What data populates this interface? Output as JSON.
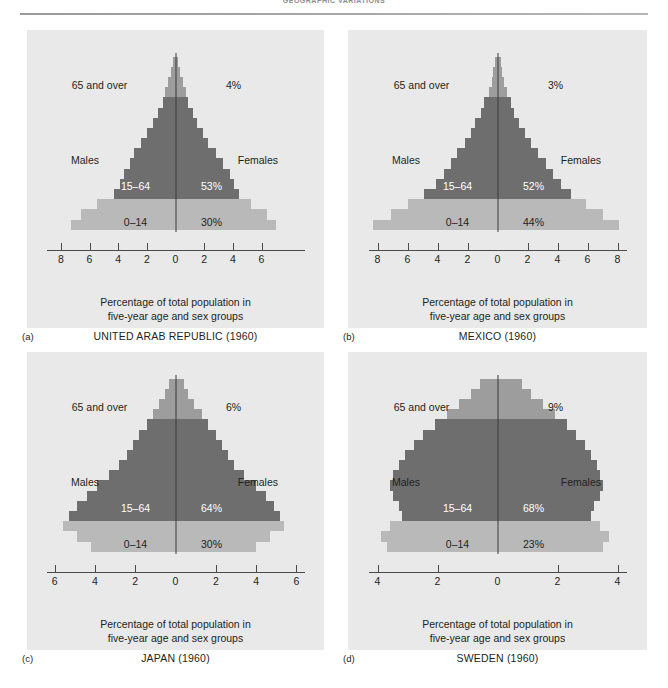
{
  "page": {
    "running_head": "GEOGRAPHIC VARIATIONS",
    "figure_labels": [
      "(a)",
      "(b)",
      "(c)",
      "(d)"
    ]
  },
  "common": {
    "caption_line1": "Percentage of total population in",
    "caption_line2": "five-year age and sex groups",
    "label_old": "65 and over",
    "label_work": "15–64",
    "label_young": "0–14",
    "label_males": "Males",
    "label_females": "Females"
  },
  "colors": {
    "young": "#b9b9b9",
    "working": "#6e6e6e",
    "old": "#9d9d9d",
    "panel_bg": "#e9e9e9",
    "axis": "#4a4a4a",
    "text": "#231f20"
  },
  "chart_data": [
    {
      "id": "a",
      "type": "bar",
      "title": "UNITED ARAB REPUBLIC (1960)",
      "country": "UNITED ARAB REPUBLIC (1960)",
      "year": 1960,
      "orientation": "population-pyramid",
      "xlabel": "Percentage of total population in five-year age and sex groups",
      "ylabel": "",
      "xlim": [
        -9,
        7.5
      ],
      "ticks": [
        8,
        6,
        4,
        2,
        0,
        2,
        4,
        6
      ],
      "tick_positions": [
        -8,
        -6,
        -4,
        -2,
        0,
        2,
        4,
        6
      ],
      "axis_left_cap": true,
      "axis_right_cap": false,
      "grid": false,
      "pct_old": "4%",
      "pct_working": "53%",
      "pct_young": "30%",
      "age_groups": [
        "0–4",
        "5–9",
        "10–14",
        "15–19",
        "20–24",
        "25–29",
        "30–34",
        "35–39",
        "40–44",
        "45–49",
        "50–54",
        "55–59",
        "60–64",
        "65–69",
        "70–74",
        "75–79",
        "80+"
      ],
      "series": [
        {
          "name": "Males",
          "values": [
            7.3,
            6.6,
            5.5,
            4.3,
            3.9,
            3.6,
            3.2,
            2.9,
            2.4,
            2.0,
            1.6,
            1.2,
            0.9,
            0.7,
            0.5,
            0.3,
            0.2
          ]
        },
        {
          "name": "Females",
          "values": [
            7.0,
            6.4,
            5.3,
            4.4,
            4.1,
            3.8,
            3.3,
            2.8,
            2.3,
            1.9,
            1.5,
            1.2,
            0.9,
            0.7,
            0.5,
            0.3,
            0.2
          ]
        }
      ],
      "bands": [
        "young",
        "young",
        "young",
        "work",
        "work",
        "work",
        "work",
        "work",
        "work",
        "work",
        "work",
        "work",
        "work",
        "old",
        "old",
        "old",
        "old"
      ]
    },
    {
      "id": "b",
      "type": "bar",
      "title": "MEXICO (1960)",
      "country": "MEXICO (1960)",
      "year": 1960,
      "orientation": "population-pyramid",
      "xlabel": "Percentage of total population in five-year age and sex groups",
      "ylabel": "",
      "xlim": [
        -8.6,
        8.6
      ],
      "ticks": [
        8,
        6,
        4,
        2,
        0,
        2,
        4,
        6,
        8
      ],
      "tick_positions": [
        -8,
        -6,
        -4,
        -2,
        0,
        2,
        4,
        6,
        8
      ],
      "axis_left_cap": true,
      "axis_right_cap": true,
      "grid": false,
      "pct_old": "3%",
      "pct_working": "52%",
      "pct_young": "44%",
      "age_groups": [
        "0–4",
        "5–9",
        "10–14",
        "15–19",
        "20–24",
        "25–29",
        "30–34",
        "35–39",
        "40–44",
        "45–49",
        "50–54",
        "55–59",
        "60–64",
        "65–69",
        "70–74",
        "75–79",
        "80+"
      ],
      "series": [
        {
          "name": "Males",
          "values": [
            8.3,
            7.1,
            6.0,
            4.9,
            4.1,
            3.6,
            3.1,
            2.7,
            2.2,
            1.8,
            1.5,
            1.1,
            0.9,
            0.6,
            0.4,
            0.3,
            0.2
          ]
        },
        {
          "name": "Females",
          "values": [
            8.1,
            7.0,
            5.9,
            4.9,
            4.2,
            3.7,
            3.2,
            2.7,
            2.2,
            1.8,
            1.4,
            1.1,
            0.9,
            0.6,
            0.4,
            0.3,
            0.2
          ]
        }
      ],
      "bands": [
        "young",
        "young",
        "young",
        "work",
        "work",
        "work",
        "work",
        "work",
        "work",
        "work",
        "work",
        "work",
        "work",
        "old",
        "old",
        "old",
        "old"
      ]
    },
    {
      "id": "c",
      "type": "bar",
      "title": "JAPAN (1960)",
      "country": "JAPAN (1960)",
      "year": 1960,
      "orientation": "population-pyramid",
      "xlabel": "Percentage of total population in five-year age and sex groups",
      "ylabel": "",
      "xlim": [
        -6.4,
        6.4
      ],
      "ticks": [
        6,
        4,
        2,
        0,
        2,
        4,
        6
      ],
      "tick_positions": [
        -6,
        -4,
        -2,
        0,
        2,
        4,
        6
      ],
      "axis_left_cap": true,
      "axis_right_cap": true,
      "grid": false,
      "pct_old": "6%",
      "pct_working": "64%",
      "pct_young": "30%",
      "age_groups": [
        "0–4",
        "5–9",
        "10–14",
        "15–19",
        "20–24",
        "25–29",
        "30–34",
        "35–39",
        "40–44",
        "45–49",
        "50–54",
        "55–59",
        "60–64",
        "65–69",
        "70–74",
        "75–79",
        "80+"
      ],
      "series": [
        {
          "name": "Males",
          "values": [
            4.2,
            4.9,
            5.6,
            5.3,
            4.9,
            4.4,
            3.9,
            3.3,
            2.8,
            2.4,
            2.1,
            1.8,
            1.4,
            1.1,
            0.8,
            0.5,
            0.3
          ]
        },
        {
          "name": "Females",
          "values": [
            4.0,
            4.7,
            5.4,
            5.2,
            4.9,
            4.5,
            4.0,
            3.4,
            2.9,
            2.6,
            2.3,
            2.0,
            1.6,
            1.3,
            0.9,
            0.6,
            0.4
          ]
        }
      ],
      "bands": [
        "young",
        "young",
        "young",
        "work",
        "work",
        "work",
        "work",
        "work",
        "work",
        "work",
        "work",
        "work",
        "work",
        "old",
        "old",
        "old",
        "old"
      ]
    },
    {
      "id": "d",
      "type": "bar",
      "title": "SWEDEN (1960)",
      "country": "SWEDEN (1960)",
      "year": 1960,
      "orientation": "population-pyramid",
      "xlabel": "Percentage of total population in five-year age and sex groups",
      "ylabel": "",
      "xlim": [
        -4.3,
        4.3
      ],
      "ticks": [
        4,
        2,
        0,
        2,
        4
      ],
      "tick_positions": [
        -4,
        -2,
        0,
        2,
        4
      ],
      "axis_left_cap": true,
      "axis_right_cap": true,
      "grid": false,
      "pct_old": "9%",
      "pct_working": "68%",
      "pct_young": "23%",
      "age_groups": [
        "0–4",
        "5–9",
        "10–14",
        "15–19",
        "20–24",
        "25–29",
        "30–34",
        "35–39",
        "40–44",
        "45–49",
        "50–54",
        "55–59",
        "60–64",
        "65–69",
        "70–74",
        "75–79",
        "80+"
      ],
      "series": [
        {
          "name": "Males",
          "values": [
            3.7,
            3.9,
            3.6,
            3.2,
            3.3,
            3.5,
            3.6,
            3.5,
            3.3,
            3.1,
            2.8,
            2.5,
            2.1,
            1.7,
            1.3,
            0.9,
            0.6
          ]
        },
        {
          "name": "Females",
          "values": [
            3.5,
            3.7,
            3.4,
            3.1,
            3.2,
            3.4,
            3.5,
            3.4,
            3.3,
            3.1,
            2.9,
            2.6,
            2.3,
            1.9,
            1.5,
            1.1,
            0.8
          ]
        }
      ],
      "bands": [
        "young",
        "young",
        "young",
        "work",
        "work",
        "work",
        "work",
        "work",
        "work",
        "work",
        "work",
        "work",
        "work",
        "old",
        "old",
        "old",
        "old"
      ]
    }
  ]
}
